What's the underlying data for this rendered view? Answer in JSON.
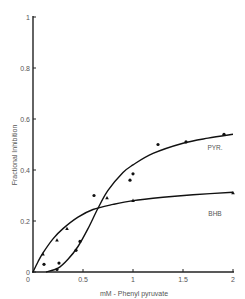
{
  "chart_data": {
    "type": "scatter",
    "title": "",
    "xlabel": "mM - Phenyl pyruvate",
    "ylabel": "Fractional Inhibition",
    "xlim": [
      0,
      2
    ],
    "ylim": [
      0,
      1
    ],
    "grid": false,
    "legend": "inline labels on curves",
    "x_ticks": [
      {
        "value": 0,
        "label": "0"
      },
      {
        "value": 0.5,
        "label": "0.5"
      },
      {
        "value": 1,
        "label": "1"
      },
      {
        "value": 1.5,
        "label": "1.5"
      },
      {
        "value": 2,
        "label": "2"
      }
    ],
    "y_ticks": [
      {
        "value": 0,
        "label": "0"
      },
      {
        "value": 0.2,
        "label": "0.2"
      },
      {
        "value": 0.4,
        "label": "0.4"
      },
      {
        "value": 0.6,
        "label": "0.6"
      },
      {
        "value": 0.8,
        "label": "0.8"
      },
      {
        "value": 1,
        "label": "1"
      }
    ],
    "series": [
      {
        "name": "PYR.",
        "marker": "circle",
        "points": [
          {
            "x": 0.11,
            "y": 0.03
          },
          {
            "x": 0.24,
            "y": 0.01
          },
          {
            "x": 0.26,
            "y": 0.035
          },
          {
            "x": 0.43,
            "y": 0.085
          },
          {
            "x": 0.47,
            "y": 0.12
          },
          {
            "x": 0.61,
            "y": 0.3
          },
          {
            "x": 0.97,
            "y": 0.36
          },
          {
            "x": 1.0,
            "y": 0.385
          },
          {
            "x": 1.25,
            "y": 0.5
          },
          {
            "x": 1.53,
            "y": 0.51
          },
          {
            "x": 1.91,
            "y": 0.54
          }
        ],
        "curve": [
          {
            "x": 0.13,
            "y": 0.0
          },
          {
            "x": 0.25,
            "y": 0.015
          },
          {
            "x": 0.35,
            "y": 0.05
          },
          {
            "x": 0.45,
            "y": 0.1
          },
          {
            "x": 0.55,
            "y": 0.17
          },
          {
            "x": 0.65,
            "y": 0.25
          },
          {
            "x": 0.75,
            "y": 0.32
          },
          {
            "x": 0.9,
            "y": 0.39
          },
          {
            "x": 1.0,
            "y": 0.42
          },
          {
            "x": 1.2,
            "y": 0.465
          },
          {
            "x": 1.5,
            "y": 0.505
          },
          {
            "x": 1.75,
            "y": 0.525
          },
          {
            "x": 2.0,
            "y": 0.54
          }
        ],
        "label_pos": {
          "x": 1.82,
          "y": 0.48
        }
      },
      {
        "name": "BHB",
        "marker": "triangle",
        "points": [
          {
            "x": 0.1,
            "y": 0.07
          },
          {
            "x": 0.24,
            "y": 0.125
          },
          {
            "x": 0.34,
            "y": 0.17
          },
          {
            "x": 0.74,
            "y": 0.29
          },
          {
            "x": 1.0,
            "y": 0.28
          },
          {
            "x": 2.0,
            "y": 0.31
          }
        ],
        "curve": [
          {
            "x": 0.0,
            "y": 0.0
          },
          {
            "x": 0.05,
            "y": 0.04
          },
          {
            "x": 0.1,
            "y": 0.075
          },
          {
            "x": 0.2,
            "y": 0.13
          },
          {
            "x": 0.3,
            "y": 0.17
          },
          {
            "x": 0.45,
            "y": 0.215
          },
          {
            "x": 0.6,
            "y": 0.245
          },
          {
            "x": 0.8,
            "y": 0.265
          },
          {
            "x": 1.0,
            "y": 0.28
          },
          {
            "x": 1.3,
            "y": 0.293
          },
          {
            "x": 1.6,
            "y": 0.303
          },
          {
            "x": 2.0,
            "y": 0.313
          }
        ],
        "label_pos": {
          "x": 1.82,
          "y": 0.22
        }
      }
    ]
  }
}
